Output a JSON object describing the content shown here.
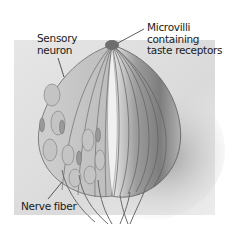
{
  "diagram": {
    "color_scheme": "grayscale",
    "labels": {
      "sensory_neuron": "Sensory\nneuron",
      "microvilli": "Microvilli\ncontaining\ntaste receptors",
      "nerve_fiber": "Nerve fiber"
    }
  }
}
